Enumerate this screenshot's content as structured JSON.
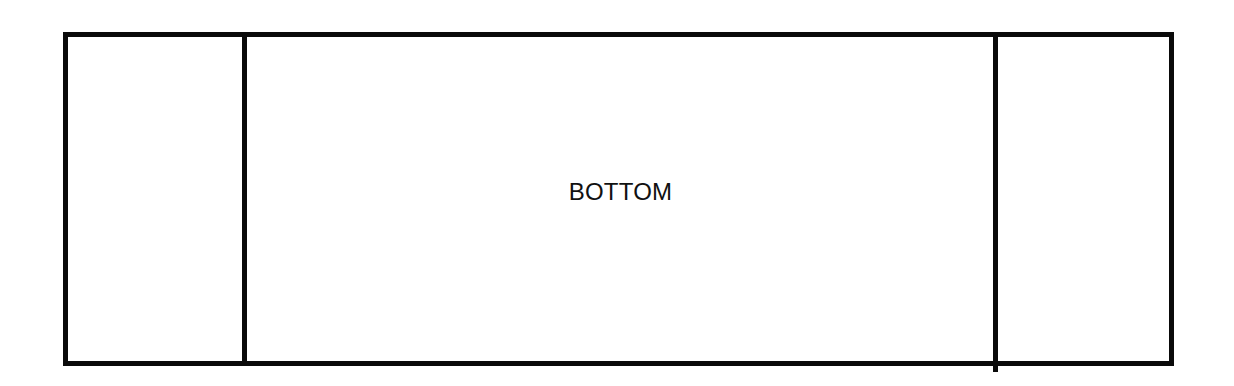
{
  "diagram": {
    "type": "partitioned-rectangle",
    "sections": [
      {
        "id": "left",
        "label": ""
      },
      {
        "id": "center",
        "label": "BOTTOM"
      },
      {
        "id": "right",
        "label": ""
      }
    ],
    "colors": {
      "stroke": "#0a0a0a",
      "background": "#ffffff",
      "text": "#111111"
    }
  }
}
